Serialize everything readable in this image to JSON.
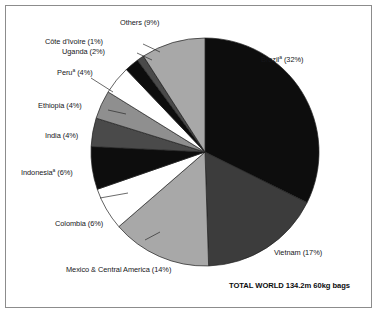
{
  "figure": {
    "background_color": "#ffffff",
    "frame_color": "#8c8c8c",
    "total_note": "TOTAL WORLD 134.2m 60kg bags"
  },
  "chart_data": {
    "type": "pie",
    "title": "",
    "subtitle": "",
    "xlabel": "",
    "ylabel": "",
    "units": "million 60kg bags",
    "total_label": "TOTAL WORLD 134.2m 60kg bags",
    "total_value": 134.2,
    "legend_position": "callout-labels",
    "grid": false,
    "start_angle_deg": -90,
    "direction": "clockwise",
    "categories": [
      "Brazil",
      "Vietnam",
      "Mexico & Central America",
      "Colombia",
      "Indonesia",
      "India",
      "Ethiopia",
      "Peru",
      "Uganda",
      "Côte d'Ivoire",
      "Others"
    ],
    "values": [
      32,
      17,
      14,
      6,
      6,
      4,
      4,
      4,
      2,
      1,
      9
    ],
    "colors": [
      "#0d0d0d",
      "#3c3c3c",
      "#a8a8a8",
      "#ffffff",
      "#0d0d0d",
      "#4a4a4a",
      "#8f8f8f",
      "#ffffff",
      "#0d0d0d",
      "#4a4a4a",
      "#a8a8a8"
    ],
    "slices": [
      {
        "name": "Brazil",
        "value": 32,
        "label": "Brazil",
        "footnote_marker": "a",
        "percent_text": "(32%)",
        "full_label": "Brazilᵃ (32%)",
        "color": "#0d0d0d"
      },
      {
        "name": "Vietnam",
        "value": 17,
        "label": "Vietnam",
        "footnote_marker": "",
        "percent_text": "(17%)",
        "full_label": "Vietnam (17%)",
        "color": "#3c3c3c"
      },
      {
        "name": "Mexico & Central America",
        "value": 14,
        "label": "Mexico & Central America",
        "footnote_marker": "",
        "percent_text": "(14%)",
        "full_label": "Mexico & Central America (14%)",
        "color": "#a8a8a8"
      },
      {
        "name": "Colombia",
        "value": 6,
        "label": "Colombia",
        "footnote_marker": "",
        "percent_text": "(6%)",
        "full_label": "Colombia (6%)",
        "color": "#ffffff"
      },
      {
        "name": "Indonesia",
        "value": 6,
        "label": "Indonesia",
        "footnote_marker": "a",
        "percent_text": "(6%)",
        "full_label": "Indonesiaᵃ (6%)",
        "color": "#0d0d0d"
      },
      {
        "name": "India",
        "value": 4,
        "label": "India",
        "footnote_marker": "",
        "percent_text": "(4%)",
        "full_label": "India (4%)",
        "color": "#4a4a4a"
      },
      {
        "name": "Ethiopia",
        "value": 4,
        "label": "Ethiopia",
        "footnote_marker": "",
        "percent_text": "(4%)",
        "full_label": "Ethiopia (4%)",
        "color": "#8f8f8f"
      },
      {
        "name": "Peru",
        "value": 4,
        "label": "Peru",
        "footnote_marker": "a",
        "percent_text": "(4%)",
        "full_label": "Peruᵃ (4%)",
        "color": "#ffffff"
      },
      {
        "name": "Uganda",
        "value": 2,
        "label": "Uganda",
        "footnote_marker": "",
        "percent_text": "(2%)",
        "full_label": "Uganda (2%)",
        "color": "#0d0d0d"
      },
      {
        "name": "Côte d'Ivoire",
        "value": 1,
        "label": "Côte d'Ivoire",
        "footnote_marker": "",
        "percent_text": "(1%)",
        "full_label": "Côte d'Ivoire (1%)",
        "color": "#4a4a4a"
      },
      {
        "name": "Others",
        "value": 9,
        "label": "Others",
        "footnote_marker": "",
        "percent_text": "(9%)",
        "full_label": "Others (9%)",
        "color": "#a8a8a8"
      }
    ]
  },
  "labels": {
    "brazil": "Brazil",
    "brazil_pct": " (32%)",
    "brazil_sup": "a",
    "vietnam": "Vietnam (17%)",
    "mexico": "Mexico & Central America (14%)",
    "colombia": "Colombia (6%)",
    "indonesia": "Indonesia",
    "indonesia_pct": " (6%)",
    "indonesia_sup": "a",
    "india": "India (4%)",
    "ethiopia": "Ethiopia (4%)",
    "peru": "Peru",
    "peru_pct": " (4%)",
    "peru_sup": "a",
    "uganda": "Uganda (2%)",
    "cote_divoire": "Côte d'Ivoire (1%)",
    "others": "Others (9%)"
  }
}
